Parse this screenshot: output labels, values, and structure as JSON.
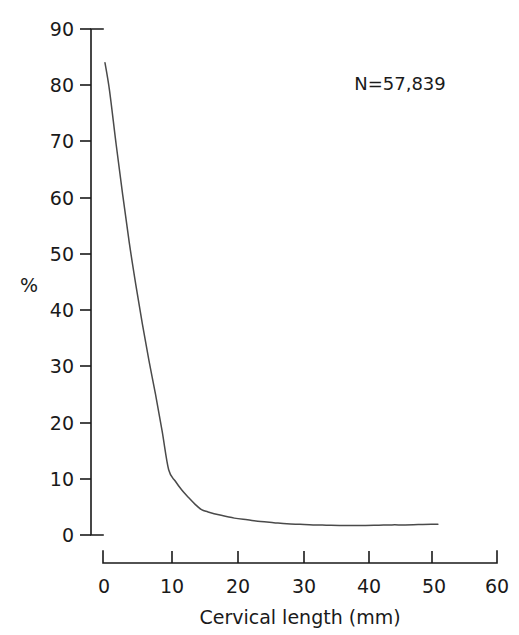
{
  "figure": {
    "annotation": "N=57,839",
    "background": "#ffffff",
    "curve_color": "#4a4a4a",
    "axis_color": "#1a1a1a"
  },
  "chart_data": {
    "type": "line",
    "title": "",
    "subtitle": "",
    "xlabel": "Cervical length (mm)",
    "ylabel": "%",
    "xlim": [
      0,
      60
    ],
    "ylim": [
      0,
      90
    ],
    "xticks": [
      0,
      10,
      20,
      30,
      40,
      50,
      60
    ],
    "xticklabels": [
      "0",
      "10",
      "20",
      "30",
      "40",
      "50",
      "60"
    ],
    "yticks": [
      0,
      10,
      20,
      30,
      40,
      50,
      60,
      70,
      80,
      90
    ],
    "yticklabels": [
      "0",
      "10",
      "20",
      "30",
      "40",
      "50",
      "60",
      "70",
      "80",
      "90"
    ],
    "grid": false,
    "legend": false,
    "legend_position": "none",
    "annotations": [
      {
        "text": "N=57,839",
        "x": 44,
        "y": 83
      }
    ],
    "series": [
      {
        "name": "Percentage",
        "x": [
          0.3,
          1,
          2,
          3,
          4,
          5,
          6,
          7,
          8,
          9,
          10,
          11,
          12,
          13,
          14,
          15,
          16,
          18,
          20,
          22,
          24,
          26,
          28,
          30,
          32,
          34,
          36,
          38,
          40,
          42,
          44,
          46,
          48,
          50,
          51
        ],
        "values": [
          84.0,
          79.0,
          69.5,
          60.5,
          52.0,
          44.5,
          37.5,
          31.0,
          25.0,
          18.5,
          11.6,
          9.6,
          8.0,
          6.7,
          5.5,
          4.5,
          4.1,
          3.5,
          3.0,
          2.7,
          2.4,
          2.2,
          2.0,
          1.9,
          1.8,
          1.75,
          1.7,
          1.7,
          1.7,
          1.75,
          1.8,
          1.8,
          1.85,
          1.9,
          1.9
        ]
      }
    ]
  }
}
